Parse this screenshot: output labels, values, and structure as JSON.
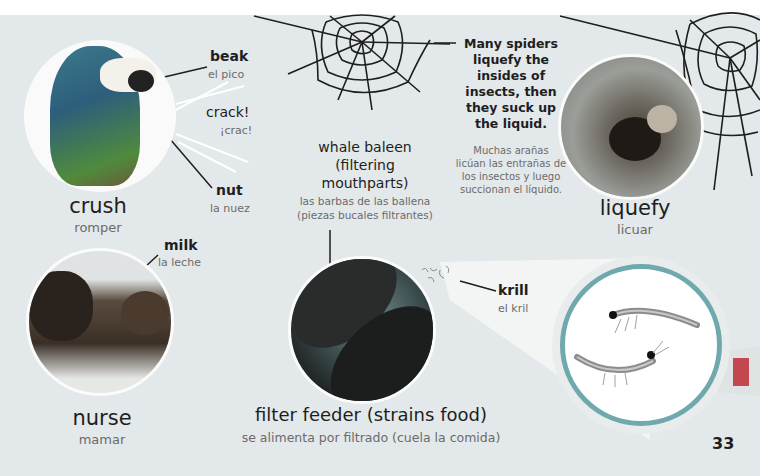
{
  "page_number": "33",
  "colors": {
    "background": "#e3e8ea",
    "top_strip": "#ffffff",
    "magnifier_ring": "#6fa9ad",
    "magnifier_handle_accent": "#c2474f",
    "text_primary": "#1e1e1e",
    "text_secondary": "#6b6b6b"
  },
  "crush": {
    "word": "crush",
    "translation": "romper",
    "labels": {
      "beak": {
        "en": "beak",
        "es": "el pico"
      },
      "crack": {
        "en": "crack!",
        "es": "¡crac!"
      },
      "nut": {
        "en": "nut",
        "es": "la nuez"
      }
    },
    "image": "parrot-photo"
  },
  "liquefy": {
    "word": "liquefy",
    "translation": "licuar",
    "fact_en": [
      "Many spiders",
      "liquefy the",
      "insides of",
      "insects, then",
      "they suck up",
      "the liquid."
    ],
    "fact_es": [
      "Muchas arañas",
      "licúan las entrañas de",
      "los insectos y luego",
      "succionan el líquido."
    ],
    "image": "spider-photo"
  },
  "nurse": {
    "word": "nurse",
    "translation": "mamar",
    "labels": {
      "milk": {
        "en": "milk",
        "es": "la leche"
      }
    },
    "image": "bear-photo"
  },
  "filter_feeder": {
    "word": "filter feeder (strains food)",
    "translation": "se alimenta por filtrado (cuela la comida)",
    "labels": {
      "baleen": {
        "en": [
          "whale baleen",
          "(filtering",
          "mouthparts)"
        ],
        "es": [
          "las barbas de las ballena",
          "(piezas bucales filtrantes)"
        ]
      },
      "krill": {
        "en": "krill",
        "es": "el kril"
      }
    },
    "image": "whale-photo",
    "magnified_image": "krill-photo"
  }
}
